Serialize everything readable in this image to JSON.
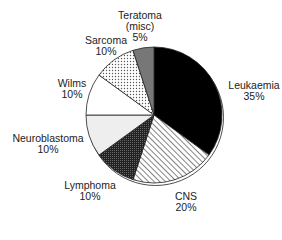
{
  "chart_data": {
    "type": "pie",
    "title": "",
    "categories": [
      "Leukaemia",
      "CNS",
      "Lymphoma",
      "Neuroblastoma",
      "Wilms",
      "Sarcoma",
      "Teratoma (misc)"
    ],
    "values": [
      35,
      20,
      10,
      10,
      10,
      10,
      5
    ],
    "labels": [
      {
        "name": "Leukaemia",
        "pct": "35%"
      },
      {
        "name": "CNS",
        "pct": "20%"
      },
      {
        "name": "Lymphoma",
        "pct": "10%"
      },
      {
        "name": "Neuroblastoma",
        "pct": "10%"
      },
      {
        "name": "Wilms",
        "pct": "10%"
      },
      {
        "name": "Sarcoma",
        "pct": "10%"
      },
      {
        "name": "Teratoma (misc)",
        "pct": "5%"
      }
    ],
    "fills": [
      "#000000",
      "hatch-diagonal",
      "#333333",
      "#eeeeee",
      "#ffffff",
      "dots",
      "#777777"
    ],
    "start_angle": "12 o'clock",
    "direction": "clockwise",
    "legend": "none (direct labels)"
  },
  "text": {
    "teratoma_line1": "Teratoma",
    "teratoma_line2": "(misc)",
    "teratoma_pct": "5%",
    "sarcoma": "Sarcoma",
    "sarcoma_pct": "10%",
    "wilms": "Wilms",
    "wilms_pct": "10%",
    "neuro": "Neuroblastoma",
    "neuro_pct": "10%",
    "lymphoma": "Lymphoma",
    "lymphoma_pct": "10%",
    "cns": "CNS",
    "cns_pct": "20%",
    "leuk": "Leukaemia",
    "leuk_pct": "35%"
  }
}
